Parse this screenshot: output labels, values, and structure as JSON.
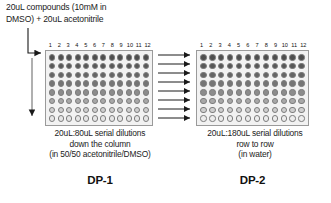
{
  "diagram": {
    "title_note": "20uL compounds (10mM in DMSO) + 20uL acetonitrile",
    "header_line1": "20uL compounds (10mM in",
    "header_line2": "DMSO) + 20uL acetonitrile"
  },
  "plates": [
    {
      "id": "DP-1",
      "label": "DP-1",
      "rows": 8,
      "columns": 12,
      "column_numbers": [
        "1",
        "2",
        "3",
        "4",
        "5",
        "6",
        "7",
        "8",
        "9",
        "10",
        "11",
        "12"
      ],
      "caption_line1": "20uL:80uL serial dilutions",
      "caption_line2": "down the column",
      "caption_line3": "(in 50/50 acetonitrile/DMSO)",
      "gradient_direction": "top-dark-to-bottom-light",
      "row_shades": [
        "#4e4e4e",
        "#575757",
        "#646464",
        "#757575",
        "#8c8c8c",
        "#a8a8a8",
        "#cfcfcf",
        "#e6e6e6"
      ]
    },
    {
      "id": "DP-2",
      "label": "DP-2",
      "rows": 8,
      "columns": 12,
      "column_numbers": [
        "1",
        "2",
        "3",
        "4",
        "5",
        "6",
        "7",
        "8",
        "9",
        "10",
        "11",
        "12"
      ],
      "caption_line1": "20uL:180uL serial dilutions",
      "caption_line2": "row to row",
      "caption_line3": "(in water)",
      "gradient_direction": "top-dark-to-bottom-light",
      "row_shades": [
        "#4e4e4e",
        "#575757",
        "#646464",
        "#757575",
        "#8c8c8c",
        "#a8a8a8",
        "#cfcfcf",
        "#ededed"
      ]
    }
  ],
  "arrows": {
    "inlet_elbow_name": "compound-addition-arrow",
    "down_column_name": "down-the-column-dilution-arrow",
    "transfer_count": 8,
    "transfer_name": "row-transfer-arrow"
  },
  "colors": {
    "stroke": "#1a1a1a",
    "plate_border": "#9a9a9a",
    "plate_fill": "#f2f2f2",
    "well_border": "#7d7d7d",
    "background": "#ffffff"
  }
}
